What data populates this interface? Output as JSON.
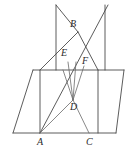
{
  "figure": {
    "width": 131,
    "height": 151,
    "stroke_color": "#4a4a4a",
    "background_color": "#ffffff",
    "label_color": "#2b2b2b"
  },
  "points": [
    {
      "id": "A",
      "label": "A",
      "x": 40,
      "y": 133,
      "label_x": 37,
      "label_y": 137
    },
    {
      "id": "B",
      "label": "B",
      "x": 78,
      "y": 32,
      "label_x": 70,
      "label_y": 19
    },
    {
      "id": "C",
      "label": "C",
      "x": 89,
      "y": 133,
      "label_x": 86,
      "label_y": 137
    },
    {
      "id": "D",
      "label": "D",
      "x": 73,
      "y": 100,
      "label_x": 70,
      "label_y": 102
    },
    {
      "id": "E",
      "label": "E",
      "x": 68,
      "y": 62,
      "label_x": 61,
      "label_y": 48
    },
    {
      "id": "F",
      "label": "F",
      "x": 84,
      "y": 70,
      "label_x": 82,
      "label_y": 56
    }
  ],
  "segments": [
    {
      "name": "base-bottom-edge",
      "x1": 13,
      "y1": 133,
      "x2": 116,
      "y2": 133
    },
    {
      "name": "base-left-edge",
      "x1": 13,
      "y1": 133,
      "x2": 33,
      "y2": 70
    },
    {
      "name": "base-top-edge",
      "x1": 33,
      "y1": 70,
      "x2": 124,
      "y2": 70
    },
    {
      "name": "base-right-edge",
      "x1": 124,
      "y1": 70,
      "x2": 116,
      "y2": 133
    },
    {
      "name": "diagonal-A-to-B",
      "x1": 40,
      "y1": 133,
      "x2": 108,
      "y2": 5
    },
    {
      "name": "upper-left-rib",
      "x1": 56,
      "y1": 5,
      "x2": 56,
      "y2": 70
    },
    {
      "name": "upper-right-rib",
      "x1": 105,
      "y1": 5,
      "x2": 105,
      "y2": 70
    },
    {
      "name": "upper-left-to-apex",
      "x1": 56,
      "y1": 5,
      "x2": 78,
      "y2": 32
    },
    {
      "name": "apex-to-lower-left",
      "x1": 78,
      "y1": 32,
      "x2": 40,
      "y2": 70
    },
    {
      "name": "apex-to-lower-right",
      "x1": 78,
      "y1": 32,
      "x2": 98,
      "y2": 70
    },
    {
      "name": "vertical-face-left",
      "x1": 40,
      "y1": 70,
      "x2": 40,
      "y2": 133
    },
    {
      "name": "vertical-face-right",
      "x1": 98,
      "y1": 70,
      "x2": 98,
      "y2": 133
    },
    {
      "name": "ray-D-to-upper-left",
      "x1": 73,
      "y1": 100,
      "x2": 63,
      "y2": 70
    },
    {
      "name": "ray-D-to-E",
      "x1": 73,
      "y1": 100,
      "x2": 68,
      "y2": 62
    },
    {
      "name": "ray-D-to-apex-B",
      "x1": 73,
      "y1": 100,
      "x2": 76,
      "y2": 62
    },
    {
      "name": "ray-D-to-F",
      "x1": 73,
      "y1": 100,
      "x2": 84,
      "y2": 66
    },
    {
      "name": "ray-D-to-C",
      "x1": 73,
      "y1": 100,
      "x2": 89,
      "y2": 133
    },
    {
      "name": "ray-D-to-A-lower",
      "x1": 73,
      "y1": 100,
      "x2": 40,
      "y2": 133
    }
  ]
}
